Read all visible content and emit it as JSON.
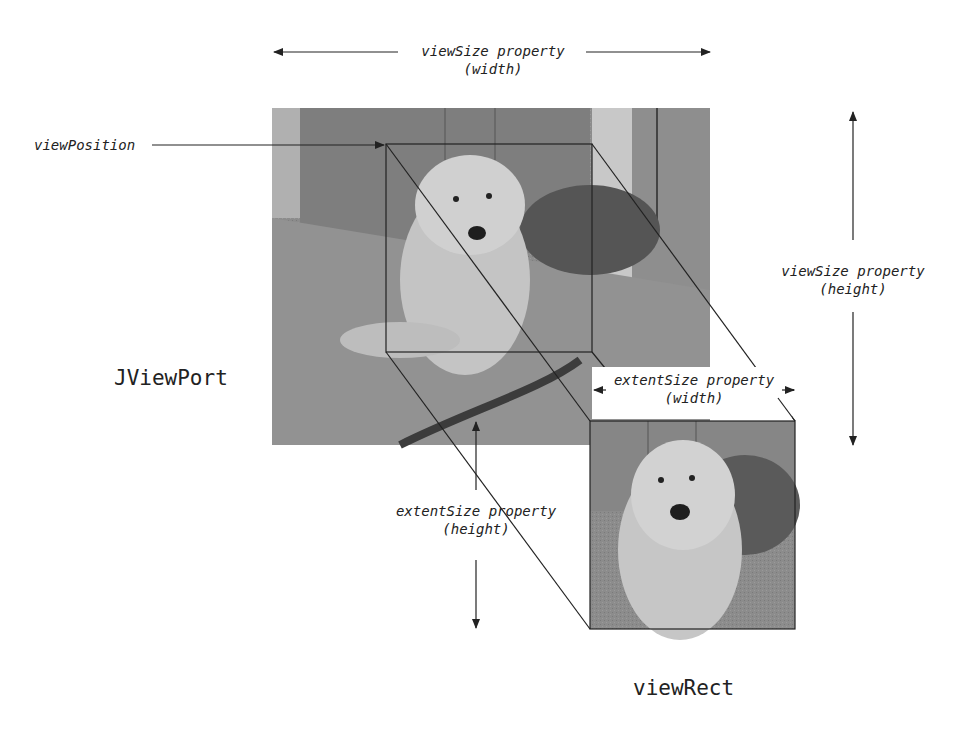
{
  "diagram": {
    "title_component": "JViewPort",
    "view_rect_label": "viewRect",
    "labels": {
      "view_position": "viewPosition",
      "view_size_width": {
        "line1": "viewSize property",
        "line2": "(width)"
      },
      "view_size_height": {
        "line1": "viewSize property",
        "line2": "(height)"
      },
      "extent_size_width": {
        "line1": "extentSize property",
        "line2": "(width)"
      },
      "extent_size_height": {
        "line1": "extentSize property",
        "line2": "(height)"
      }
    },
    "images": {
      "view": "dog-photo-full",
      "extent": "dog-photo-cropped"
    },
    "colors": {
      "line": "#222222",
      "photo_bg": "#8a8a8a",
      "background": "#ffffff"
    }
  }
}
